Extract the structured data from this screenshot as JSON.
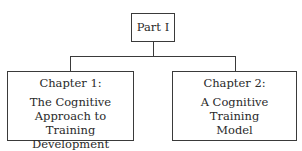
{
  "diagram": {
    "root": {
      "label": "Part I"
    },
    "children": [
      {
        "title": "Chapter 1:",
        "lines": [
          "The Cognitive",
          "Approach to",
          "Training Development"
        ]
      },
      {
        "title": "Chapter 2:",
        "lines": [
          "A Cognitive",
          "Training",
          "Model"
        ]
      }
    ]
  }
}
